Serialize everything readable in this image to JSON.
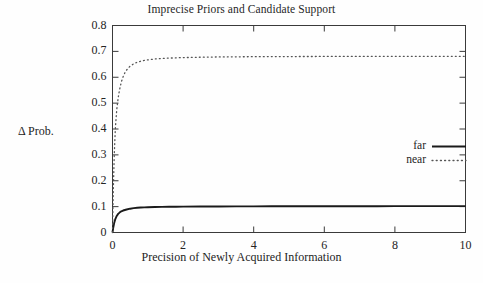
{
  "chart_data": {
    "type": "line",
    "title": "Imprecise Priors and Candidate Support",
    "xlabel": "Precision of Newly Acquired Information",
    "ylabel": "Δ Prob.",
    "xlim": [
      0,
      10
    ],
    "ylim": [
      0,
      0.8
    ],
    "grid": false,
    "legend_position": "right-middle",
    "xticks": [
      "0",
      "2",
      "4",
      "6",
      "8",
      "10"
    ],
    "xtick_values": [
      0,
      2,
      4,
      6,
      8,
      10
    ],
    "yticks": [
      "0",
      "0.1",
      "0.2",
      "0.3",
      "0.4",
      "0.5",
      "0.6",
      "0.7",
      "0.8"
    ],
    "ytick_values": [
      0,
      0.1,
      0.2,
      0.3,
      0.4,
      0.5,
      0.6,
      0.7,
      0.8
    ],
    "x": [
      0,
      0.02,
      0.05,
      0.08,
      0.12,
      0.16,
      0.2,
      0.25,
      0.3,
      0.35,
      0.4,
      0.5,
      0.6,
      0.7,
      0.8,
      0.9,
      1.0,
      1.2,
      1.4,
      1.6,
      1.8,
      2.0,
      2.5,
      3.0,
      3.5,
      4.0,
      4.5,
      5.0,
      5.5,
      6.0,
      6.5,
      7.0,
      7.5,
      8.0,
      8.5,
      9.0,
      9.5,
      10.0
    ],
    "series": [
      {
        "name": "far",
        "style": "solid",
        "color": "#1a1a1a",
        "asymptote": 0.102,
        "values": [
          0,
          0.018,
          0.038,
          0.052,
          0.064,
          0.072,
          0.077,
          0.082,
          0.085,
          0.087,
          0.089,
          0.092,
          0.094,
          0.0955,
          0.0965,
          0.0972,
          0.0978,
          0.0986,
          0.0991,
          0.0995,
          0.0998,
          0.1,
          0.1004,
          0.1007,
          0.1009,
          0.101,
          0.1012,
          0.1013,
          0.1014,
          0.1015,
          0.1016,
          0.1016,
          0.1017,
          0.1018,
          0.1018,
          0.1019,
          0.1019,
          0.102
        ]
      },
      {
        "name": "near",
        "style": "dotted",
        "color": "#555555",
        "asymptote": 0.681,
        "values": [
          0,
          0.15,
          0.3,
          0.4,
          0.475,
          0.52,
          0.552,
          0.582,
          0.602,
          0.617,
          0.628,
          0.643,
          0.652,
          0.658,
          0.662,
          0.665,
          0.667,
          0.6705,
          0.6725,
          0.674,
          0.675,
          0.676,
          0.6775,
          0.6785,
          0.679,
          0.6795,
          0.6798,
          0.68,
          0.6802,
          0.6804,
          0.6805,
          0.6806,
          0.6807,
          0.6808,
          0.6809,
          0.681,
          0.681,
          0.681
        ]
      }
    ],
    "legend_entries": [
      {
        "label": "far",
        "style": "solid"
      },
      {
        "label": "near",
        "style": "dotted"
      }
    ]
  }
}
